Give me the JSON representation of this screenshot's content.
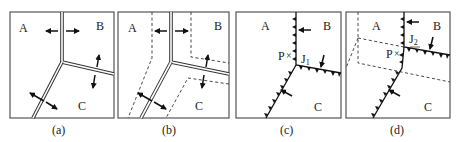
{
  "figure": {
    "panels": [
      {
        "id": "a",
        "caption": "(a)",
        "plates": {
          "A": "A",
          "B": "B",
          "C": "C"
        },
        "boundaries": "double lines (ridges)",
        "arrows": "spreading arrows across each ridge"
      },
      {
        "id": "b",
        "caption": "(b)",
        "plates": {
          "A": "A",
          "B": "B",
          "C": "C"
        },
        "boundaries": "double lines (ridges) with dashed offset outlines",
        "arrows": "spreading arrows across each ridge"
      },
      {
        "id": "c",
        "caption": "(c)",
        "plates": {
          "A": "A",
          "B": "B",
          "C": "C"
        },
        "point_label": "P",
        "point_marker": "×",
        "junction_label": "J",
        "junction_subscript": "1",
        "boundaries": "trenches with triangle teeth",
        "arrows": "convergence arrows"
      },
      {
        "id": "d",
        "caption": "(d)",
        "plates": {
          "A": "A",
          "B": "B",
          "C": "C"
        },
        "point_label": "P",
        "point_marker": "×",
        "junction_label": "J",
        "junction_subscript": "2",
        "boundaries": "trenches with triangle teeth, dashed previous position",
        "arrows": "convergence arrows"
      }
    ]
  }
}
